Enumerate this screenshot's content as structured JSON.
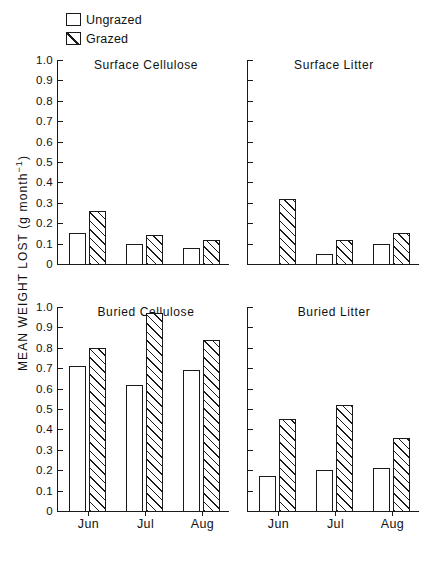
{
  "legend": {
    "items": [
      {
        "label": "Ungrazed",
        "swatch": "empty-square-icon"
      },
      {
        "label": "Grazed",
        "swatch": "hatched-square-icon"
      }
    ]
  },
  "axis": {
    "ylabel_text": "MEAN WEIGHT LOST (g month",
    "ylabel_exponent": "−1",
    "ylabel_close": ")",
    "ytick_labels": [
      "1.0",
      "0.9",
      "0.8",
      "0.7",
      "0.6",
      "0.5",
      "0.4",
      "0.3",
      "0.2",
      "0.1",
      "0"
    ],
    "xtick_labels": [
      "Jun",
      "Jul",
      "Aug"
    ]
  },
  "chart_data": {
    "type": "bar",
    "title": "",
    "xlabel": "",
    "ylabel": "MEAN WEIGHT LOST (g month−1)",
    "ylim": [
      0,
      1.0
    ],
    "ytick_values": [
      0,
      0.1,
      0.2,
      0.3,
      0.4,
      0.5,
      0.6,
      0.7,
      0.8,
      0.9,
      1.0
    ],
    "grid": false,
    "legend_position": "top-left",
    "categories": [
      "Jun",
      "Jul",
      "Aug"
    ],
    "panels": [
      {
        "title": "Surface Cellulose",
        "position": "top-left",
        "series": [
          {
            "name": "Ungrazed",
            "values": [
              0.15,
              0.1,
              0.08
            ]
          },
          {
            "name": "Grazed",
            "values": [
              0.26,
              0.14,
              0.12
            ]
          }
        ]
      },
      {
        "title": "Surface Litter",
        "position": "top-right",
        "series": [
          {
            "name": "Ungrazed",
            "values": [
              0.0,
              0.05,
              0.1
            ]
          },
          {
            "name": "Grazed",
            "values": [
              0.32,
              0.12,
              0.15
            ]
          }
        ]
      },
      {
        "title": "Buried Cellulose",
        "position": "bottom-left",
        "series": [
          {
            "name": "Ungrazed",
            "values": [
              0.71,
              0.62,
              0.69
            ]
          },
          {
            "name": "Grazed",
            "values": [
              0.8,
              0.97,
              0.84
            ]
          }
        ]
      },
      {
        "title": "Buried Litter",
        "position": "bottom-right",
        "series": [
          {
            "name": "Ungrazed",
            "values": [
              0.17,
              0.2,
              0.21
            ]
          },
          {
            "name": "Grazed",
            "values": [
              0.45,
              0.52,
              0.36
            ]
          }
        ]
      }
    ]
  }
}
